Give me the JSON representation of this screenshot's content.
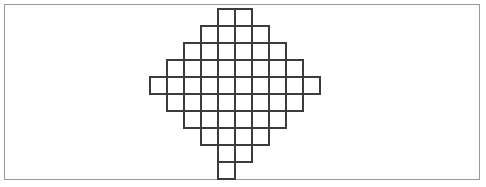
{
  "figure": {
    "background_color": "#ffffff",
    "frame": {
      "name": "outer-border",
      "color": "#9a9a9a",
      "stroke_width": 1,
      "x": 4,
      "y": 4,
      "width": 476,
      "height": 176
    },
    "grid": {
      "cell_size": 17,
      "origin_x": 150,
      "origin_y": 9,
      "line_color": "#3c3c3c",
      "stroke_width": 2,
      "columns": 10,
      "rows": 10
    },
    "shape": {
      "type": "diamond",
      "total_cells": 60,
      "rows": [
        {
          "index": 0,
          "start_col": 4,
          "cells": 2
        },
        {
          "index": 1,
          "start_col": 3,
          "cells": 4
        },
        {
          "index": 2,
          "start_col": 2,
          "cells": 6
        },
        {
          "index": 3,
          "start_col": 1,
          "cells": 8
        },
        {
          "index": 4,
          "start_col": 0,
          "cells": 10
        },
        {
          "index": 5,
          "start_col": 1,
          "cells": 8
        },
        {
          "index": 6,
          "start_col": 2,
          "cells": 6
        },
        {
          "index": 7,
          "start_col": 3,
          "cells": 4
        },
        {
          "index": 8,
          "start_col": 4,
          "cells": 2
        },
        {
          "index": 9,
          "start_col": 4,
          "cells": 1
        }
      ],
      "row_cell_counts": [
        2,
        4,
        6,
        8,
        10,
        8,
        6,
        4,
        2,
        1
      ]
    }
  }
}
